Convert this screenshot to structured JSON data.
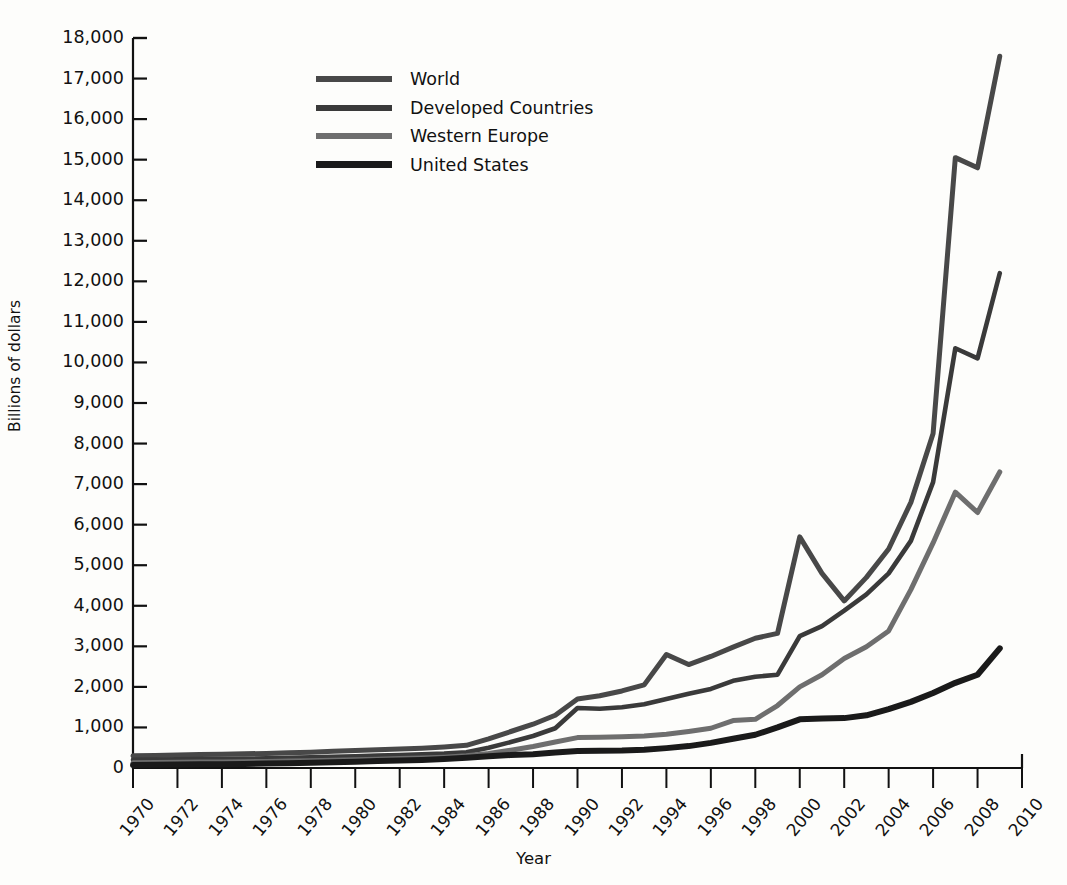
{
  "chart_data": {
    "type": "line",
    "title": "",
    "xlabel": "Year",
    "ylabel": "Billions of dollars",
    "grid": false,
    "legend_position": "upper-left-inside",
    "xlim": [
      1970,
      2010
    ],
    "ylim": [
      0,
      18000
    ],
    "ytick_step": 1000,
    "xtick_step": 2,
    "x": [
      1970,
      1971,
      1972,
      1973,
      1974,
      1975,
      1976,
      1977,
      1978,
      1979,
      1980,
      1981,
      1982,
      1983,
      1984,
      1985,
      1986,
      1987,
      1988,
      1989,
      1990,
      1991,
      1992,
      1993,
      1994,
      1995,
      1996,
      1997,
      1998,
      1999,
      2000,
      2001,
      2002,
      2003,
      2004,
      2005,
      2006,
      2007,
      2008,
      2009
    ],
    "xtick_labels": [
      "1970",
      "1972",
      "1974",
      "1976",
      "1978",
      "1980",
      "1982",
      "1984",
      "1986",
      "1988",
      "1990",
      "1992",
      "1994",
      "1996",
      "1998",
      "2000",
      "2002",
      "2004",
      "2006",
      "2008",
      "2010"
    ],
    "ytick_labels": [
      "0",
      "1,000",
      "2,000",
      "3,000",
      "4,000",
      "5,000",
      "6,000",
      "7,000",
      "8,000",
      "9,000",
      "10,000",
      "11,000",
      "12,000",
      "13,000",
      "14,000",
      "15,000",
      "16,000",
      "17,000",
      "18,000"
    ],
    "series": [
      {
        "name": "World",
        "color": "#484848",
        "values": [
          300,
          310,
          320,
          330,
          340,
          350,
          360,
          375,
          390,
          410,
          430,
          450,
          470,
          490,
          520,
          560,
          720,
          900,
          1080,
          1300,
          1700,
          1780,
          1900,
          2050,
          2800,
          2550,
          2750,
          2980,
          3200,
          3320,
          5700,
          4800,
          4120,
          4700,
          5400,
          6550,
          8250,
          15050,
          14800,
          17550
        ]
      },
      {
        "name": "Developed Countries",
        "color": "#3a3a3a",
        "values": [
          200,
          210,
          215,
          220,
          225,
          230,
          240,
          250,
          262,
          275,
          290,
          305,
          320,
          335,
          355,
          390,
          500,
          640,
          790,
          980,
          1480,
          1460,
          1500,
          1570,
          1700,
          1830,
          1950,
          2150,
          2250,
          2300,
          3250,
          3500,
          3880,
          4280,
          4800,
          5600,
          7050,
          10350,
          10100,
          12200
        ]
      },
      {
        "name": "Western Europe",
        "color": "#6e6e6e",
        "values": [
          130,
          135,
          140,
          145,
          150,
          155,
          162,
          170,
          180,
          192,
          205,
          218,
          232,
          248,
          268,
          300,
          360,
          440,
          530,
          640,
          750,
          760,
          770,
          790,
          830,
          900,
          980,
          1170,
          1200,
          1540,
          2000,
          2300,
          2700,
          2990,
          3380,
          4400,
          5550,
          6800,
          6300,
          7300
        ]
      },
      {
        "name": "United States",
        "color": "#1a1a1a",
        "values": [
          75,
          80,
          85,
          90,
          95,
          100,
          108,
          118,
          128,
          140,
          155,
          170,
          185,
          200,
          220,
          250,
          290,
          320,
          340,
          380,
          420,
          425,
          430,
          450,
          490,
          540,
          620,
          720,
          820,
          1000,
          1200,
          1220,
          1230,
          1300,
          1450,
          1630,
          1850,
          2100,
          2300,
          2950
        ]
      }
    ]
  },
  "legend": {
    "items": [
      {
        "label": "World"
      },
      {
        "label": "Developed Countries"
      },
      {
        "label": "Western Europe"
      },
      {
        "label": "United States"
      }
    ]
  },
  "axes": {
    "y_title": "Billions of dollars",
    "x_title": "Year"
  }
}
